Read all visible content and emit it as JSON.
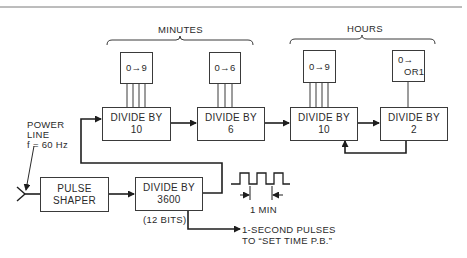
{
  "groups": {
    "minutes": "MINUTES",
    "hours": "HOURS"
  },
  "counters": [
    {
      "id": "min-units",
      "line1": "0→9",
      "line2": ""
    },
    {
      "id": "min-tens",
      "line1": "0→6",
      "line2": ""
    },
    {
      "id": "hr-units",
      "line1": "0→9",
      "line2": ""
    },
    {
      "id": "hr-tens",
      "line1": "0→",
      "line2": "OR1"
    }
  ],
  "dividers": [
    {
      "id": "div10-min",
      "line1": "DIVIDE BY",
      "line2": "10"
    },
    {
      "id": "div6",
      "line1": "DIVIDE BY",
      "line2": "6"
    },
    {
      "id": "div10-hr",
      "line1": "DIVIDE BY",
      "line2": "10"
    },
    {
      "id": "div2",
      "line1": "DIVIDE BY",
      "line2": "2"
    },
    {
      "id": "div3600",
      "line1": "DIVIDE BY",
      "line2": "3600",
      "note": "(12 BITS)"
    }
  ],
  "pulse_shaper": {
    "line1": "PULSE",
    "line2": "SHAPER"
  },
  "power_line": {
    "line1": "POWER",
    "line2": "LINE",
    "line3": "f = 60 Hz"
  },
  "waveform": {
    "period_label": "1 MIN"
  },
  "output": {
    "line1": "1-SECOND PULSES",
    "line2": "TO “SET TIME P.B.”"
  },
  "colors": {
    "line": "#2a2a2a",
    "background": "#ffffff"
  }
}
